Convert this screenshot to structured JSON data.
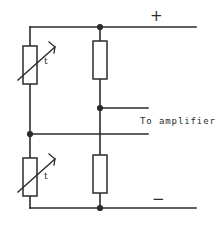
{
  "diagram": {
    "stroke_color": "#2b2b2b",
    "background_color": "#ffffff",
    "labels": {
      "positive_terminal": "+",
      "negative_terminal": "−",
      "amplifier_output": "To amplifier",
      "thermistor_top_marker": "t",
      "thermistor_bottom_marker": "t"
    },
    "components": [
      {
        "name": "thermistor-top-left",
        "type": "thermistor",
        "marker": "t",
        "branch": "left",
        "position": "upper"
      },
      {
        "name": "thermistor-bottom-left",
        "type": "thermistor",
        "marker": "t",
        "branch": "left",
        "position": "lower"
      },
      {
        "name": "resistor-top-right",
        "type": "resistor",
        "marker": "",
        "branch": "right",
        "position": "upper"
      },
      {
        "name": "resistor-bottom-right",
        "type": "resistor",
        "marker": "",
        "branch": "right",
        "position": "lower"
      }
    ],
    "nodes": [
      {
        "name": "supply-positive-junction",
        "x": 100,
        "y": 27,
        "filled": true
      },
      {
        "name": "amplifier-tap-right",
        "x": 100,
        "y": 108,
        "filled": true
      },
      {
        "name": "amplifier-tap-left",
        "x": 30,
        "y": 134,
        "filled": true
      },
      {
        "name": "supply-negative-junction",
        "x": 100,
        "y": 208,
        "filled": true
      }
    ]
  }
}
